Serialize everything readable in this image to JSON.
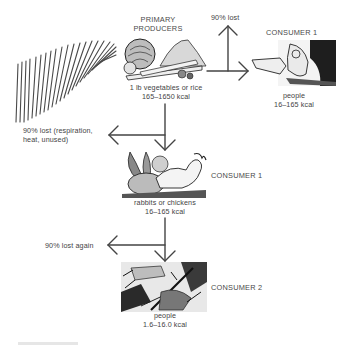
{
  "diagram": {
    "type": "energy-flow food chain",
    "colors": {
      "ink": "#3a3a3a",
      "background": "#ffffff"
    },
    "sun": {
      "icon": "sun-rays-icon"
    },
    "primary_producers": {
      "title_line1": "PRIMARY",
      "title_line2": "PRODUCERS",
      "icon": "vegetables-icon",
      "desc": "1 lb vegetables or rice",
      "energy": "165–1650 kcal"
    },
    "loss_respiration": {
      "line1": "90% lost (respiration,",
      "line2": "heat, unused)"
    },
    "loss_top": {
      "label": "90% lost"
    },
    "consumer1_people": {
      "title": "CONSUMER 1",
      "icon": "person-eating-icon",
      "desc": "people",
      "energy": "16–165 kcal"
    },
    "consumer1_animals": {
      "title": "CONSUMER 1",
      "icon": "rabbit-chicken-icon",
      "desc": "rabbits or chickens",
      "energy": "16–165 kcal"
    },
    "loss_again": {
      "label": "90% lost again"
    },
    "consumer2_people": {
      "title": "CONSUMER 2",
      "icon": "people-eating-meat-icon",
      "desc": "people",
      "energy": "1.6–16.0 kcal"
    }
  }
}
